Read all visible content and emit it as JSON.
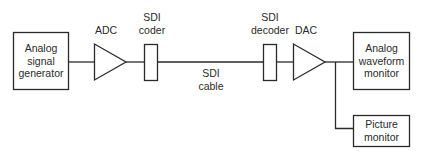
{
  "diagram": {
    "type": "signal-flow block diagram",
    "nodes": [
      {
        "id": "gen",
        "label_lines": [
          "Analog",
          "signal",
          "generator"
        ],
        "shape": "box"
      },
      {
        "id": "adc",
        "label": "ADC",
        "shape": "triangle"
      },
      {
        "id": "coder",
        "label_lines": [
          "SDI",
          "coder"
        ],
        "shape": "narrow-rect"
      },
      {
        "id": "cable",
        "label_lines": [
          "SDI",
          "cable"
        ],
        "shape": "line-label"
      },
      {
        "id": "decoder",
        "label_lines": [
          "SDI",
          "decoder"
        ],
        "shape": "narrow-rect"
      },
      {
        "id": "dac",
        "label": "DAC",
        "shape": "triangle"
      },
      {
        "id": "waveform",
        "label_lines": [
          "Analog",
          "waveform",
          "monitor"
        ],
        "shape": "box"
      },
      {
        "id": "picture",
        "label_lines": [
          "Picture",
          "monitor"
        ],
        "shape": "box"
      }
    ],
    "edges": [
      [
        "gen",
        "adc"
      ],
      [
        "adc",
        "coder"
      ],
      [
        "coder",
        "decoder"
      ],
      [
        "decoder",
        "dac"
      ],
      [
        "dac",
        "waveform"
      ],
      [
        "dac",
        "picture"
      ]
    ],
    "colors": {
      "stroke": "#2a2a2a",
      "background": "#ffffff"
    }
  }
}
